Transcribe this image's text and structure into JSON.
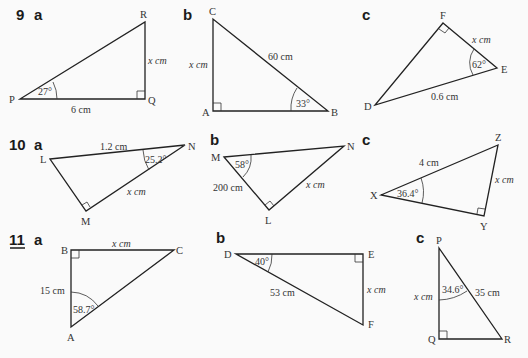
{
  "questions": [
    {
      "number": "9",
      "underlined": false,
      "parts": [
        {
          "label": "a",
          "vertices": {
            "P": "P",
            "Q": "Q",
            "R": "R"
          },
          "right_angle_at": "Q",
          "angle": "27°",
          "angle_at": "P",
          "sides": {
            "PQ": "6 cm",
            "QR": "x cm"
          }
        },
        {
          "label": "b",
          "vertices": {
            "A": "A",
            "B": "B",
            "C": "C"
          },
          "right_angle_at": "A",
          "angle": "33°",
          "angle_at": "B",
          "sides": {
            "BC": "60 cm",
            "AC": "x cm"
          }
        },
        {
          "label": "c",
          "vertices": {
            "D": "D",
            "E": "E",
            "F": "F"
          },
          "right_angle_at": "F",
          "angle": "62°",
          "angle_at": "E",
          "sides": {
            "DE": "0.6 cm",
            "EF": "x cm"
          }
        }
      ]
    },
    {
      "number": "10",
      "underlined": false,
      "parts": [
        {
          "label": "a",
          "vertices": {
            "L": "L",
            "M": "M",
            "N": "N"
          },
          "right_angle_at": "M",
          "angle": "25.2°",
          "angle_at": "N",
          "sides": {
            "LN": "1.2 cm",
            "MN": "x cm"
          }
        },
        {
          "label": "b",
          "vertices": {
            "L": "L",
            "M": "M",
            "N": "N"
          },
          "right_angle_at": "L",
          "angle": "58°",
          "angle_at": "M",
          "sides": {
            "ML": "200 cm",
            "LN": "x cm"
          }
        },
        {
          "label": "c",
          "vertices": {
            "X": "X",
            "Y": "Y",
            "Z": "Z"
          },
          "right_angle_at": "Y",
          "angle": "36.4°",
          "angle_at": "X",
          "sides": {
            "XZ": "4 cm",
            "YZ": "x cm"
          }
        }
      ]
    },
    {
      "number": "11",
      "underlined": true,
      "parts": [
        {
          "label": "a",
          "vertices": {
            "A": "A",
            "B": "B",
            "C": "C"
          },
          "right_angle_at": "B",
          "angle": "58.7°",
          "angle_at": "A",
          "sides": {
            "AB": "15 cm",
            "BC": "x cm"
          }
        },
        {
          "label": "b",
          "vertices": {
            "D": "D",
            "E": "E",
            "F": "F"
          },
          "right_angle_at": "E",
          "angle": "40°",
          "angle_at": "D",
          "sides": {
            "DF": "53 cm",
            "EF": "x cm"
          }
        },
        {
          "label": "c",
          "vertices": {
            "P": "P",
            "Q": "Q",
            "R": "R"
          },
          "right_angle_at": "Q",
          "angle": "34.6°",
          "angle_at": "P",
          "sides": {
            "PR": "35 cm",
            "PQ": "x cm"
          }
        }
      ]
    }
  ]
}
